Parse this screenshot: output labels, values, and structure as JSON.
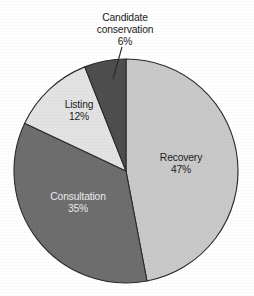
{
  "chart_data": {
    "type": "pie",
    "title": "",
    "subtitle": "",
    "xlabel": "",
    "ylabel": "",
    "legend_position": "none",
    "grid": false,
    "units": "percent",
    "total": 100,
    "start_angle_deg": 0,
    "direction": "clockwise",
    "categories": [
      "Recovery",
      "Consultation",
      "Listing",
      "Candidate conservation"
    ],
    "values": [
      47,
      35,
      12,
      6
    ],
    "slices": [
      {
        "name": "Recovery",
        "label": "Recovery",
        "value": 47,
        "value_text": "47%",
        "color": "#c9c9c9",
        "label_placement": "inside",
        "label_color": "#1d1d1d"
      },
      {
        "name": "Consultation",
        "label": "Consultation",
        "value": 35,
        "value_text": "35%",
        "color": "#6e6e6e",
        "label_placement": "inside",
        "label_color": "#ebebeb"
      },
      {
        "name": "Listing",
        "label": "Listing",
        "value": 12,
        "value_text": "12%",
        "color": "#e3e3e3",
        "label_placement": "inside",
        "label_color": "#1d1d1d"
      },
      {
        "name": "Candidate conservation",
        "label_line1": "Candidate",
        "label_line2": "conservation",
        "value": 6,
        "value_text": "6%",
        "color": "#4e4e4e",
        "label_placement": "outside",
        "label_color": "#1d1d1d",
        "has_leader_line": true
      }
    ],
    "style": {
      "background": "#ffffff",
      "slice_outline": "#2b2b2b",
      "leader_line": "#2b2b2b"
    },
    "geometry": {
      "center_x": 126,
      "center_y": 171,
      "radius": 112
    }
  }
}
